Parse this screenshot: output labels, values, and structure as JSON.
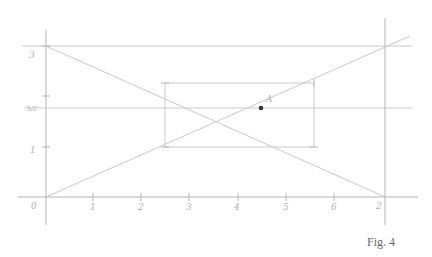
{
  "figure": {
    "caption": "Fig. 4",
    "style": "hand-drawn pencil construction on white paper",
    "colors": {
      "line": "#c9c9c9",
      "point": "#333333",
      "caption": "#6a6a6a"
    }
  },
  "axes": {
    "x_labels": [
      "0",
      "1",
      "2",
      "3",
      "4",
      "5",
      "6",
      "2"
    ],
    "y_labels": [
      "0",
      "1",
      "3/2",
      "3"
    ]
  },
  "labels": {
    "point": "A",
    "y_top": "3",
    "y_mid": "3/2",
    "y_one": "1",
    "origin": "0",
    "x_end": "2",
    "x1": "1",
    "x2": "2",
    "x3": "3",
    "x4": "4",
    "x5": "5",
    "x6": "6"
  },
  "elements": {
    "point_A": {
      "x": 261,
      "y": 108
    },
    "rectangle": {
      "left": 165,
      "top": 83,
      "right": 314,
      "bottom": 147
    },
    "descending_line": {
      "from": [
        46,
        46
      ],
      "to": [
        385,
        197
      ]
    },
    "ascending_line": {
      "from": [
        46,
        197
      ],
      "to": [
        410,
        36
      ]
    }
  }
}
